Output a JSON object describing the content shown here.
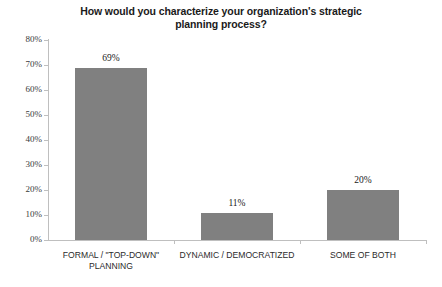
{
  "chart_data": {
    "type": "bar",
    "title": "How would you characterize your organization's strategic planning process?",
    "title_line1": "How would you characterize your organization's strategic",
    "title_line2": "planning process?",
    "categories": [
      "FORMAL / \"TOP-DOWN\" PLANNING",
      "DYNAMIC / DEMOCRATIZED",
      "SOME OF BOTH"
    ],
    "category_lines": [
      [
        "FORMAL / \"TOP-DOWN\"",
        "PLANNING"
      ],
      [
        "DYNAMIC / DEMOCRATIZED"
      ],
      [
        "SOME OF BOTH"
      ]
    ],
    "values": [
      69,
      11,
      20
    ],
    "value_labels": [
      "69%",
      "11%",
      "20%"
    ],
    "xlabel": "",
    "ylabel": "",
    "ylim": [
      0,
      80
    ],
    "ytick_values": [
      80,
      70,
      60,
      50,
      40,
      30,
      20,
      10,
      0
    ],
    "ytick_labels": [
      "80%",
      "70%",
      "60%",
      "50%",
      "40%",
      "30%",
      "20%",
      "10%",
      "0%"
    ],
    "grid": false,
    "legend": false,
    "legend_position": "none",
    "bar_color": "#808080",
    "axis_color": "#bfbfbf",
    "text_color": "#1a1a1a",
    "background_color": "#ffffff"
  }
}
